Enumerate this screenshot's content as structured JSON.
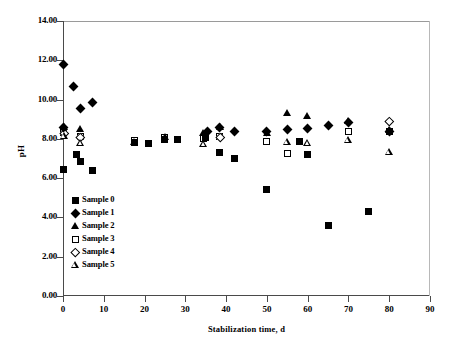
{
  "chart_data": {
    "type": "scatter",
    "title": "",
    "xlabel": "Stabilization time, d",
    "ylabel": "pH",
    "xlim": [
      0,
      90
    ],
    "ylim": [
      0,
      14
    ],
    "xticks": [
      "0",
      "10",
      "20",
      "30",
      "40",
      "50",
      "60",
      "70",
      "80",
      "90"
    ],
    "xtick_values": [
      0,
      10,
      20,
      30,
      40,
      50,
      60,
      70,
      80,
      90
    ],
    "yticks": [
      "0.00",
      "2.00",
      "4.00",
      "6.00",
      "8.00",
      "10.00",
      "12.00",
      "14.00"
    ],
    "ytick_values": [
      0,
      2,
      4,
      6,
      8,
      10,
      12,
      14
    ],
    "grid": false,
    "legend_position": "inside-lower-left",
    "series": [
      {
        "name": "Sample 0",
        "marker": "filled-square",
        "points": [
          [
            0.2,
            6.45
          ],
          [
            3.2,
            7.2
          ],
          [
            4.3,
            6.85
          ],
          [
            7.2,
            6.4
          ],
          [
            17.5,
            7.8
          ],
          [
            21.0,
            7.75
          ],
          [
            25.0,
            7.95
          ],
          [
            28.0,
            7.95
          ],
          [
            35.0,
            8.05
          ],
          [
            38.5,
            7.3
          ],
          [
            42.0,
            7.0
          ],
          [
            50.0,
            5.4
          ],
          [
            58.0,
            7.85
          ],
          [
            60.0,
            7.2
          ],
          [
            65.0,
            3.6
          ],
          [
            75.0,
            4.3
          ],
          [
            80.0,
            8.4
          ]
        ]
      },
      {
        "name": "Sample 1",
        "marker": "filled-diamond",
        "points": [
          [
            0.2,
            11.8
          ],
          [
            2.5,
            10.65
          ],
          [
            4.3,
            9.55
          ],
          [
            7.2,
            9.85
          ],
          [
            0.2,
            8.6
          ],
          [
            35.5,
            8.4
          ],
          [
            38.5,
            8.6
          ],
          [
            42.0,
            8.35
          ],
          [
            50.0,
            8.4
          ],
          [
            55.0,
            8.5
          ],
          [
            60.0,
            8.55
          ],
          [
            65.0,
            8.7
          ],
          [
            70.0,
            8.85
          ],
          [
            80.0,
            8.4
          ]
        ]
      },
      {
        "name": "Sample 2",
        "marker": "filled-triangle",
        "points": [
          [
            0.2,
            8.6
          ],
          [
            4.3,
            8.5
          ],
          [
            17.5,
            7.85
          ],
          [
            25.0,
            8.1
          ],
          [
            34.5,
            8.3
          ],
          [
            38.5,
            8.6
          ],
          [
            50.0,
            8.3
          ],
          [
            55.0,
            9.3
          ],
          [
            60.0,
            9.15
          ],
          [
            70.0,
            8.9
          ],
          [
            80.0,
            8.45
          ]
        ]
      },
      {
        "name": "Sample 3",
        "marker": "open-square",
        "points": [
          [
            0.2,
            8.3
          ],
          [
            4.3,
            8.1
          ],
          [
            17.5,
            7.9
          ],
          [
            25.0,
            8.05
          ],
          [
            34.5,
            8.0
          ],
          [
            38.5,
            8.1
          ],
          [
            50.0,
            7.85
          ],
          [
            55.0,
            7.25
          ],
          [
            60.0,
            7.2
          ],
          [
            70.0,
            8.4
          ],
          [
            80.0,
            8.35
          ]
        ]
      },
      {
        "name": "Sample 4",
        "marker": "open-diamond",
        "points": [
          [
            0.2,
            8.3
          ],
          [
            4.3,
            8.1
          ],
          [
            38.5,
            8.1
          ],
          [
            80.0,
            8.9
          ]
        ]
      },
      {
        "name": "Sample 5",
        "marker": "open-triangle",
        "points": [
          [
            0.2,
            8.35
          ],
          [
            4.3,
            8.15
          ],
          [
            34.5,
            8.25
          ],
          [
            55.0,
            8.5
          ],
          [
            60.0,
            8.6
          ],
          [
            70.0,
            8.9
          ],
          [
            80.0,
            8.45
          ]
        ]
      }
    ]
  }
}
